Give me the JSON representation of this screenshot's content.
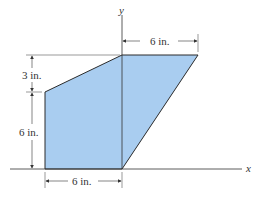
{
  "figure": {
    "shape_fill": "#a9cdf0",
    "shape_stroke": "#2b2b2b",
    "axes": {
      "x_label": "x",
      "y_label": "y"
    },
    "dimensions": {
      "top_width": "6 in.",
      "left_upper_height": "3 in.",
      "left_lower_height": "6 in.",
      "bottom_width": "6 in."
    }
  }
}
